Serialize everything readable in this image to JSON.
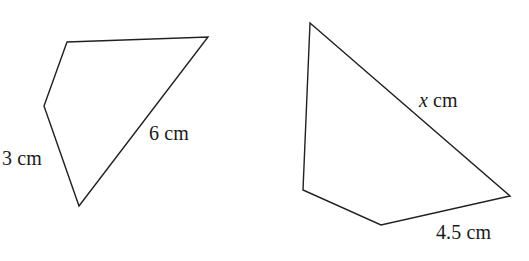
{
  "figure": {
    "background_color": "#ffffff",
    "stroke_color": "#231f20",
    "shapes": [
      {
        "name": "left-quadrilateral",
        "points": "67,42 208,37 79,206 44,106",
        "labels": [
          {
            "id": "left-3cm",
            "value": "3",
            "unit": "cm",
            "text": "3 cm",
            "italic": false
          },
          {
            "id": "left-6cm",
            "value": "6",
            "unit": "cm",
            "text": "6 cm",
            "italic": false
          }
        ]
      },
      {
        "name": "right-quadrilateral",
        "points": "310,23 510,196 381,225 303,190",
        "labels": [
          {
            "id": "right-x",
            "value": "x",
            "unit": "cm",
            "text": "x cm",
            "italic": true
          },
          {
            "id": "right-45",
            "value": "4.5",
            "unit": "cm",
            "text": "4.5 cm",
            "italic": false
          }
        ]
      }
    ]
  },
  "labels": {
    "left_side_3cm": {
      "number": "3",
      "unit": "cm"
    },
    "left_side_6cm": {
      "number": "6",
      "unit": "cm"
    },
    "right_side_x": {
      "number": "x",
      "unit": "cm"
    },
    "right_side_45cm": {
      "number": "4.5",
      "unit": "cm"
    }
  }
}
